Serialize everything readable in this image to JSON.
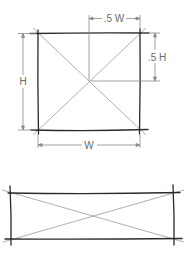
{
  "diagram": {
    "square": {
      "labels": {
        "half_width": ".5 W",
        "half_height": ".5 H",
        "height": "H",
        "width": "W"
      }
    },
    "colors": {
      "outline": "#2a2a2a",
      "diagonal": "#9a9a9a",
      "dimension": "#8a8a8a",
      "label": "#6a6a6a"
    }
  }
}
